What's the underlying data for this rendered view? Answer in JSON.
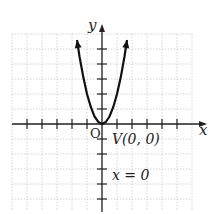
{
  "chart_data": {
    "type": "line",
    "title": "",
    "function": "y = 2x^2",
    "xlabel": "x",
    "ylabel": "y",
    "xlim": [
      -6,
      6
    ],
    "ylim": [
      -6,
      6
    ],
    "grid": true,
    "x_ticks": [
      -5,
      -4,
      -3,
      -2,
      -1,
      1,
      2,
      3,
      4,
      5
    ],
    "y_ticks": [
      -5,
      -4,
      -3,
      -2,
      -1,
      1,
      2,
      3,
      4,
      5
    ],
    "series": [
      {
        "name": "parabola",
        "x": [
          -1.67,
          -1.5,
          -1.25,
          -1,
          -0.75,
          -0.5,
          -0.25,
          0,
          0.25,
          0.5,
          0.75,
          1,
          1.25,
          1.5,
          1.67
        ],
        "y": [
          5.6,
          4.5,
          3.13,
          2,
          1.13,
          0.5,
          0.13,
          0,
          0.13,
          0.5,
          1.13,
          2,
          3.13,
          4.5,
          5.6
        ]
      }
    ],
    "annotations": [
      {
        "text": "V(0, 0)",
        "x": 0,
        "y": 0,
        "meaning": "vertex"
      },
      {
        "text": "x = 0",
        "meaning": "axis of symmetry"
      },
      {
        "text": "O",
        "meaning": "origin"
      }
    ]
  },
  "labels": {
    "x_axis": "x",
    "y_axis": "y",
    "origin": "O",
    "vertex": "V(0, 0)",
    "axis_of_symmetry": "x = 0"
  },
  "colors": {
    "curve": "#111111",
    "axis": "#222222",
    "grid": "#c8c8c8"
  }
}
